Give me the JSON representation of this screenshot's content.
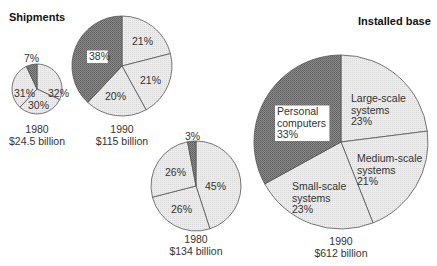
{
  "titles": {
    "left": "Shipments",
    "right": "Installed base"
  },
  "colors": {
    "dark_fill": "#7c7c7c",
    "light_fill": "#e6e6e6",
    "stroke": "#555555",
    "label_box": "#ffffff"
  },
  "chart_data": [
    {
      "type": "pie",
      "group": "Shipments",
      "title": "1980",
      "subtitle": "$24.5 billion",
      "center": [
        37,
        89
      ],
      "radius": 25,
      "slices": [
        {
          "label": "",
          "value": 32,
          "text": "32%",
          "dark": false,
          "lx": 48,
          "ly": 97
        },
        {
          "label": "",
          "value": 30,
          "text": "30%",
          "dark": false,
          "lx": 28,
          "ly": 109
        },
        {
          "label": "",
          "value": 31,
          "text": "31%",
          "dark": false,
          "lx": 14,
          "ly": 97
        },
        {
          "label": "",
          "value": 7,
          "text": "7%",
          "dark": true,
          "lx": 24,
          "ly": 62
        }
      ],
      "caption_y": [
        133,
        145
      ]
    },
    {
      "type": "pie",
      "group": "Shipments",
      "title": "1990",
      "subtitle": "$115 billion",
      "center": [
        122,
        66
      ],
      "radius": 50,
      "slices": [
        {
          "label": "",
          "value": 21,
          "text": "21%",
          "dark": false,
          "lx": 132,
          "ly": 45
        },
        {
          "label": "",
          "value": 21,
          "text": "21%",
          "dark": false,
          "lx": 140,
          "ly": 84
        },
        {
          "label": "",
          "value": 20,
          "text": "20%",
          "dark": false,
          "lx": 105,
          "ly": 100
        },
        {
          "label": "",
          "value": 38,
          "text": "38%",
          "dark": true,
          "lx": 89,
          "ly": 60,
          "boxed": true
        }
      ],
      "caption_y": [
        133,
        145
      ]
    },
    {
      "type": "pie",
      "group": "Installed base",
      "title": "1980",
      "subtitle": "$134 billion",
      "center": [
        196,
        186
      ],
      "radius": 45,
      "slices": [
        {
          "label": "",
          "value": 45,
          "text": "45%",
          "dark": false,
          "lx": 205,
          "ly": 190
        },
        {
          "label": "",
          "value": 26,
          "text": "26%",
          "dark": false,
          "lx": 171,
          "ly": 213
        },
        {
          "label": "",
          "value": 26,
          "text": "26%",
          "dark": false,
          "lx": 165,
          "ly": 176
        },
        {
          "label": "",
          "value": 3,
          "text": "3%",
          "dark": true,
          "lx": 185,
          "ly": 140
        }
      ],
      "caption_y": [
        243,
        255
      ]
    },
    {
      "type": "pie",
      "group": "Installed base",
      "title": "1990",
      "subtitle": "$612 billion",
      "center": [
        341,
        142
      ],
      "radius": 87,
      "slices": [
        {
          "label": "Large-scale systems",
          "value": 23,
          "text": "23%",
          "dark": false,
          "lines": [
            "Large-scale",
            "systems",
            "23%"
          ],
          "lx": 351,
          "ly": 102
        },
        {
          "label": "Medium-scale systems",
          "value": 21,
          "text": "21%",
          "dark": false,
          "lines": [
            "Medium-scale",
            "systems",
            "21%"
          ],
          "lx": 357,
          "ly": 162
        },
        {
          "label": "Small-scale systems",
          "value": 23,
          "text": "23%",
          "dark": false,
          "lines": [
            "Small-scale",
            "systems",
            "23%"
          ],
          "lx": 292,
          "ly": 190
        },
        {
          "label": "Personal computers",
          "value": 33,
          "text": "33%",
          "dark": true,
          "lines": [
            "Personal",
            "computers",
            "33%"
          ],
          "lx": 277,
          "ly": 115,
          "boxed": true
        }
      ],
      "caption_y": [
        245,
        257
      ]
    }
  ]
}
